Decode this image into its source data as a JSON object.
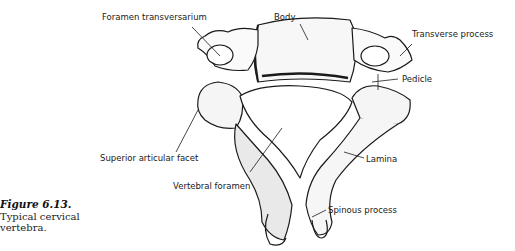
{
  "figure": {
    "number": "Figure 6.13.",
    "caption": "Typical cervical vertebra."
  },
  "labels": [
    {
      "id": "foramen-transversarium",
      "text": "Foramen transversarium"
    },
    {
      "id": "body",
      "text": "Body"
    },
    {
      "id": "transverse-process",
      "text": "Transverse process"
    },
    {
      "id": "pedicle",
      "text": "Pedicle"
    },
    {
      "id": "superior-articular-facet",
      "text": "Superior articular facet"
    },
    {
      "id": "lamina",
      "text": "Lamina"
    },
    {
      "id": "vertebral-foramen",
      "text": "Vertebral foramen"
    },
    {
      "id": "spinous-process",
      "text": "Spinous process"
    }
  ],
  "colors": {
    "ink": "#1a1a1a",
    "background": "#ffffff"
  }
}
